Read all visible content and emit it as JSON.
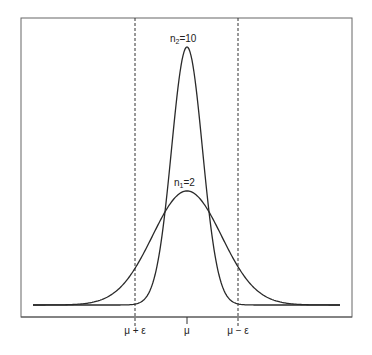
{
  "chart_data": {
    "type": "line",
    "title": "",
    "xlabel": "",
    "ylabel": "",
    "grid": false,
    "legend": "none (curves labeled inline)",
    "x_ticks": [
      {
        "label": "μ + ε",
        "position": -1.5
      },
      {
        "label": "μ",
        "position": 0
      },
      {
        "label": "μ − ε",
        "position": 1.5
      }
    ],
    "vlines": [
      {
        "position": -1.5,
        "style": "dashed"
      },
      {
        "position": 1.5,
        "style": "dashed"
      }
    ],
    "series": [
      {
        "name": "n₁=2",
        "mean": 0,
        "sd": 1.0,
        "peak_relative": 0.442,
        "label_text": "n₁=2"
      },
      {
        "name": "n₂=10",
        "mean": 0,
        "sd": 0.447,
        "peak_relative": 1.0,
        "label_text": "n₂=10"
      }
    ],
    "xlim": [
      -4.5,
      4.5
    ]
  },
  "labels": {
    "n2": "n",
    "n2_sub": "2",
    "n2_eq": "=10",
    "n1": "n",
    "n1_sub": "1",
    "n1_eq": "=2",
    "tick_left": "μ + ε",
    "tick_center": "μ",
    "tick_right": "μ − ε"
  },
  "colors": {
    "line": "#2a2a2a",
    "frame": "#555555",
    "background": "#ffffff"
  }
}
